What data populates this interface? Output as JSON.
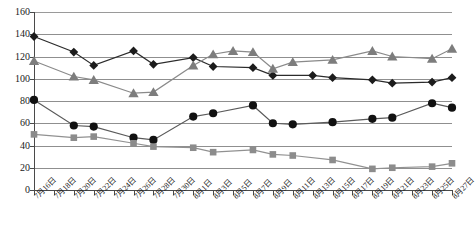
{
  "chart_data": {
    "type": "line",
    "title": "",
    "subtitle": "",
    "xlabel": "",
    "ylabel": "",
    "ylim": [
      0,
      160
    ],
    "ytick_values": [
      0,
      20,
      40,
      60,
      80,
      100,
      120,
      140,
      160
    ],
    "ytick_labels": [
      "0",
      "20",
      "40",
      "60",
      "80",
      "100",
      "120",
      "140",
      "160"
    ],
    "grid": "horizontal",
    "legend": "none",
    "categories": [
      "7月16日",
      "7月18日",
      "7月20日",
      "7月22日",
      "7月24日",
      "7月26日",
      "7月28日",
      "7月30日",
      "8月1日",
      "8月3日",
      "8月5日",
      "8月7日",
      "8月9日",
      "8月11日",
      "8月13日",
      "8月15日",
      "8月17日",
      "8月19日",
      "8月21日",
      "8月23日",
      "8月25日",
      "8月27日"
    ],
    "series": [
      {
        "name": "series-diamond",
        "marker": "diamond",
        "color": "#1c1c1c",
        "line_color": "#2b2b2b",
        "x": [
          0,
          2,
          3,
          5,
          6,
          8,
          9,
          11,
          12,
          14,
          15,
          17,
          18,
          20,
          21
        ],
        "values": [
          138,
          124,
          112,
          125,
          113,
          119,
          111,
          110,
          103,
          103,
          101,
          99,
          96,
          97,
          101
        ]
      },
      {
        "name": "series-triangle",
        "marker": "triangle",
        "color": "#7d7d7d",
        "line_color": "#8a8a8a",
        "x": [
          0,
          2,
          3,
          5,
          6,
          8,
          9,
          10,
          11,
          12,
          13,
          15,
          17,
          18,
          20,
          21
        ],
        "values": [
          116,
          102,
          99,
          87,
          88,
          112,
          122,
          125,
          124,
          109,
          115,
          117,
          125,
          120,
          118,
          127
        ]
      },
      {
        "name": "series-circle",
        "marker": "circle",
        "color": "#111111",
        "line_color": "#5a5a5a",
        "x": [
          0,
          2,
          3,
          5,
          6,
          8,
          9,
          11,
          12,
          13,
          15,
          17,
          18,
          20,
          21
        ],
        "values": [
          81,
          58,
          57,
          47,
          45,
          66,
          69,
          76,
          60,
          59,
          61,
          64,
          65,
          78,
          74
        ]
      },
      {
        "name": "series-square",
        "marker": "square",
        "color": "#8c8c8c",
        "line_color": "#919191",
        "x": [
          0,
          2,
          3,
          5,
          6,
          8,
          9,
          11,
          12,
          13,
          15,
          17,
          18,
          20,
          21
        ],
        "values": [
          50,
          47,
          48,
          42,
          39,
          38,
          34,
          36,
          32,
          31,
          27,
          19,
          20,
          21,
          24
        ]
      }
    ],
    "colors": {
      "axis": "#4a4a4a",
      "gridline": "#8f8f8f",
      "background": "#ffffff",
      "text": "#1a1a1a"
    }
  }
}
